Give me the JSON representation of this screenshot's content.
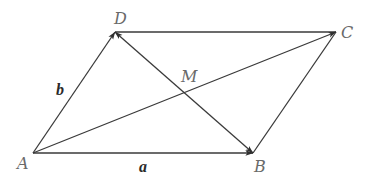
{
  "diagram": {
    "type": "parallelogram-vectors",
    "colors": {
      "stroke": "#3a3a3a",
      "vertex_label": "#6a6a6a",
      "vector_label": "#2a2a2a",
      "background": "#ffffff"
    },
    "vertices": {
      "A": {
        "label": "A",
        "x": 33,
        "y": 153
      },
      "B": {
        "label": "B",
        "x": 253,
        "y": 153
      },
      "C": {
        "label": "C",
        "x": 336,
        "y": 32
      },
      "D": {
        "label": "D",
        "x": 115,
        "y": 32
      },
      "M": {
        "label": "M",
        "x": 185,
        "y": 92
      }
    },
    "edges": [
      {
        "from": "A",
        "to": "B",
        "arrow": "end",
        "label": "a"
      },
      {
        "from": "A",
        "to": "D",
        "arrow": "end",
        "label": "b"
      },
      {
        "from": "D",
        "to": "C",
        "arrow": "none"
      },
      {
        "from": "B",
        "to": "C",
        "arrow": "none"
      },
      {
        "from": "A",
        "to": "C",
        "arrow": "end"
      },
      {
        "from": "D",
        "to": "B",
        "arrow": "both"
      }
    ],
    "labels": {
      "A": "A",
      "B": "B",
      "C": "C",
      "D": "D",
      "M": "M",
      "a": "a",
      "b": "b"
    }
  }
}
